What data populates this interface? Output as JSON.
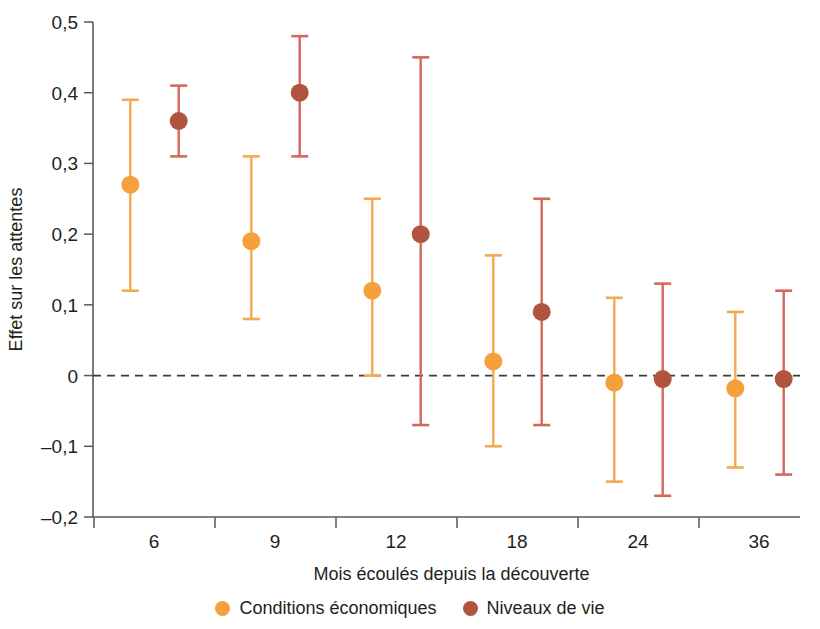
{
  "chart_data": {
    "type": "scatter",
    "title": "",
    "xlabel": "Mois écoulés depuis la découverte",
    "ylabel": "Effet sur les attentes",
    "categories": [
      "6",
      "9",
      "12",
      "18",
      "24",
      "36"
    ],
    "ylim": [
      -0.2,
      0.5
    ],
    "ytick_labels": [
      "0,5",
      "0,4",
      "0,3",
      "0,2",
      "0,1",
      "0",
      "–0,1",
      "–0,2"
    ],
    "ytick_values": [
      0.5,
      0.4,
      0.3,
      0.2,
      0.1,
      0,
      -0.1,
      -0.2
    ],
    "grid": false,
    "zero_reference_line": 0,
    "legend_position": "bottom-center",
    "series": [
      {
        "name": "Conditions économiques",
        "color": "#F5A03C",
        "errorbar_color": "#F5A94F",
        "values": [
          0.27,
          0.19,
          0.12,
          0.02,
          -0.01,
          -0.018
        ],
        "ci_low": [
          0.12,
          0.08,
          0.0,
          -0.1,
          -0.15,
          -0.13
        ],
        "ci_high": [
          0.39,
          0.31,
          0.25,
          0.17,
          0.11,
          0.09
        ]
      },
      {
        "name": "Niveaux de vie",
        "color": "#B0543F",
        "errorbar_color": "#D2695B",
        "values": [
          0.36,
          0.4,
          0.2,
          0.09,
          -0.005,
          -0.005
        ],
        "ci_low": [
          0.31,
          0.31,
          -0.07,
          -0.07,
          -0.17,
          -0.14
        ],
        "ci_high": [
          0.41,
          0.48,
          0.45,
          0.25,
          0.13,
          0.12
        ]
      }
    ]
  },
  "legend": {
    "items": [
      {
        "label": "Conditions économiques",
        "color": "#F5A03C"
      },
      {
        "label": "Niveaux de vie",
        "color": "#B0543F"
      }
    ]
  }
}
